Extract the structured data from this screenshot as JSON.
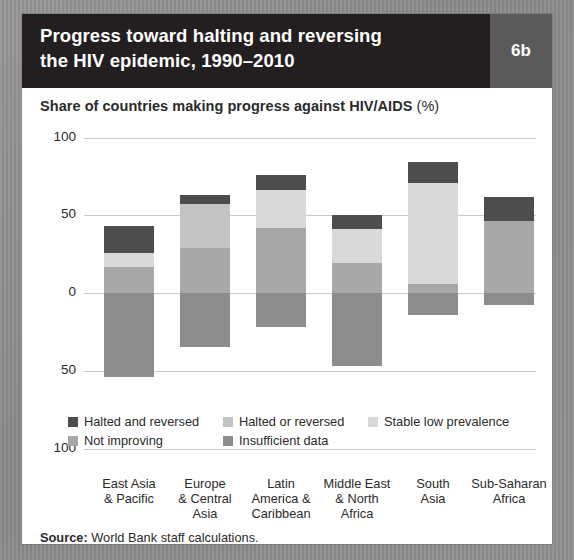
{
  "header": {
    "title_line1": "Progress toward halting and reversing",
    "title_line2": "the HIV epidemic, 1990–2010",
    "badge": "6b"
  },
  "subtitle": {
    "text": "Share of countries making progress against HIV/AIDS",
    "unit": "(%)"
  },
  "source": {
    "label": "Source:",
    "text": "World Bank staff calculations."
  },
  "chart_data": {
    "type": "bar",
    "title": "Progress toward halting and reversing the HIV epidemic, 1990–2010",
    "subtitle": "Share of countries making progress against HIV/AIDS (%)",
    "stacked": true,
    "diverging": true,
    "xlabel": "",
    "ylabel": "",
    "ylim": [
      -100,
      100
    ],
    "yticks": [
      100,
      50,
      0,
      -50,
      -100
    ],
    "ytick_labels": [
      "100",
      "50",
      "0",
      "50",
      "100"
    ],
    "grid": true,
    "legend_position": "bottom",
    "colors": {
      "halted_and_reversed": "#4d4d4d",
      "halted_or_reversed": "#c3c3c3",
      "stable_low_prevalence": "#d9d9d9",
      "not_improving": "#a8a8a8",
      "insufficient_data": "#8d8d8d"
    },
    "categories": [
      "East Asia\n& Pacific",
      "Europe\n& Central\nAsia",
      "Latin\nAmerica &\nCaribbean",
      "Middle East\n& North\nAfrica",
      "South\nAsia",
      "Sub-Saharan\nAfrica"
    ],
    "series": [
      {
        "name": "Halted and reversed",
        "key": "halted_and_reversed",
        "values": [
          17,
          6,
          10,
          9,
          13,
          16
        ]
      },
      {
        "name": "Halted or reversed",
        "key": "halted_or_reversed",
        "values": [
          0,
          28,
          0,
          0,
          0,
          0
        ]
      },
      {
        "name": "Stable low prevalence",
        "key": "stable_low_prevalence",
        "values": [
          9,
          0,
          24,
          22,
          65,
          0
        ]
      },
      {
        "name": "Not improving",
        "key": "not_improving",
        "values": [
          17,
          29,
          42,
          19,
          6,
          46
        ]
      },
      {
        "name": "Insufficient data",
        "key": "insufficient_data",
        "values": [
          -54,
          -35,
          -22,
          -47,
          -14,
          -8
        ]
      }
    ],
    "totals_positive": [
      43,
      63,
      76,
      50,
      84,
      90
    ],
    "totals_negative": [
      -54,
      -35,
      -22,
      -47,
      -14,
      -8
    ]
  },
  "legend": [
    {
      "label": "Halted and reversed",
      "key": "halted_and_reversed"
    },
    {
      "label": "Halted or reversed",
      "key": "halted_or_reversed"
    },
    {
      "label": "Stable low prevalence",
      "key": "stable_low_prevalence"
    },
    {
      "label": "Not improving",
      "key": "not_improving"
    },
    {
      "label": "Insufficient data",
      "key": "insufficient_data"
    }
  ]
}
